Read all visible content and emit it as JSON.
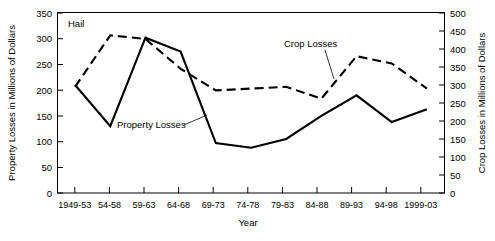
{
  "chart_data": {
    "type": "line",
    "title": "Hail",
    "xlabel": "Year",
    "ylabel": "Property Losses in Millions of Dollars",
    "y2label": "Crop Losses in Millions of Dollars",
    "categories": [
      "1949-53",
      "54-58",
      "59-63",
      "64-68",
      "69-73",
      "74-78",
      "79-83",
      "84-88",
      "89-93",
      "94-98",
      "1999-03"
    ],
    "ylim": [
      0,
      350
    ],
    "yticks": [
      0,
      50,
      100,
      150,
      200,
      250,
      300,
      350
    ],
    "y2lim": [
      0,
      500
    ],
    "y2ticks": [
      0,
      50,
      100,
      150,
      200,
      250,
      300,
      350,
      400,
      450,
      500
    ],
    "grid": false,
    "legend_position": "inline-annotations",
    "series": [
      {
        "name": "Property Losses",
        "axis": "left",
        "style": "solid",
        "color": "#000000",
        "values": [
          210,
          130,
          302,
          275,
          97,
          88,
          105,
          150,
          190,
          138,
          163
        ]
      },
      {
        "name": "Crop Losses",
        "axis": "right",
        "style": "dashed",
        "color": "#000000",
        "values": [
          295,
          438,
          428,
          345,
          285,
          290,
          295,
          262,
          380,
          360,
          290
        ]
      }
    ],
    "annotations": [
      {
        "label": "Hail",
        "kind": "plot-title-inset"
      },
      {
        "label": "Property Losses",
        "kind": "series-callout",
        "series": "Property Losses"
      },
      {
        "label": "Crop Losses",
        "kind": "series-callout",
        "series": "Crop Losses"
      }
    ]
  }
}
